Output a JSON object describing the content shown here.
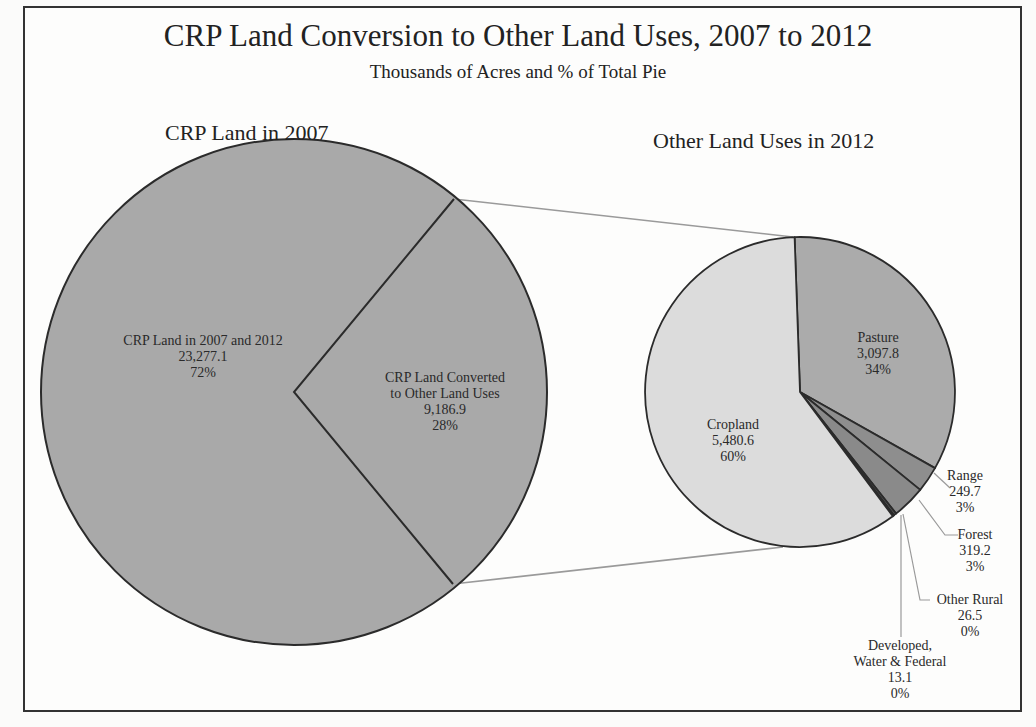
{
  "title": "CRP Land Conversion to Other Land Uses, 2007 to 2012",
  "subtitle": "Thousands of Acres and % of Total Pie",
  "left_pie": {
    "title": "CRP Land in 2007",
    "slices": [
      {
        "label": "CRP Land in 2007 and 2012",
        "value": "23,277.1",
        "pct": "72%"
      },
      {
        "label_line1": "CRP Land Converted",
        "label_line2": "to Other Land Uses",
        "value": "9,186.9",
        "pct": "28%"
      }
    ]
  },
  "right_pie": {
    "title": "Other Land Uses in 2012",
    "slices": [
      {
        "label": "Pasture",
        "value": "3,097.8",
        "pct": "34%"
      },
      {
        "label": "Range",
        "value": "249.7",
        "pct": "3%"
      },
      {
        "label": "Forest",
        "value": "319.2",
        "pct": "3%"
      },
      {
        "label": "Other Rural",
        "value": "26.5",
        "pct": "0%"
      },
      {
        "label_line1": "Developed,",
        "label_line2": "Water & Federal",
        "value": "13.1",
        "pct": "0%"
      },
      {
        "label": "Cropland",
        "value": "5,480.6",
        "pct": "60%"
      }
    ]
  },
  "colors": {
    "crp_main": "#a9a9a9",
    "pasture": "#ababab",
    "range": "#8e8e8e",
    "forest": "#8a8a8a",
    "other_rural": "#555555",
    "developed": "#333333",
    "cropland": "#dcdcdc",
    "outline": "#2b2b2b",
    "connector": "#9a9a9a"
  },
  "chart_data": [
    {
      "type": "pie",
      "title": "CRP Land in 2007",
      "categories": [
        "CRP Land in 2007 and 2012",
        "CRP Land Converted to Other Land Uses"
      ],
      "values": [
        23277.1,
        9186.9
      ],
      "percent": [
        72,
        28
      ],
      "units": "Thousands of Acres"
    },
    {
      "type": "pie",
      "title": "Other Land Uses in 2012",
      "categories": [
        "Pasture",
        "Range",
        "Forest",
        "Other Rural",
        "Developed, Water & Federal",
        "Cropland"
      ],
      "values": [
        3097.8,
        249.7,
        319.2,
        26.5,
        13.1,
        5480.6
      ],
      "percent": [
        34,
        3,
        3,
        0,
        0,
        60
      ],
      "units": "Thousands of Acres"
    }
  ]
}
